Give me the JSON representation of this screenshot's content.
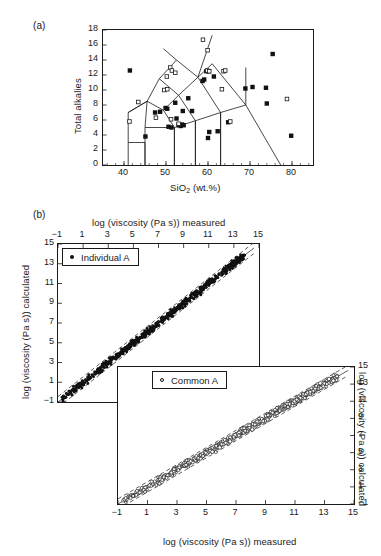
{
  "figure": {
    "panel_a_letter": "(a)",
    "panel_b_letter": "(b)"
  },
  "panel_a": {
    "xlabel_pre": "SiO",
    "xlabel_sub": "2",
    "xlabel_post": " (wt.%)",
    "ylabel": "Total alkalies",
    "x_ticks": [
      "40",
      "50",
      "60",
      "70",
      "80"
    ],
    "y_ticks": [
      "0",
      "2",
      "4",
      "6",
      "8",
      "10",
      "12",
      "14",
      "16",
      "18"
    ]
  },
  "panel_b": {
    "top_xlabel": "log (viscosity (Pa s)) measured",
    "bottom_xlabel": "log (viscosity (Pa s)) measured",
    "left_ylabel": "log (viscosity (Pa s)) calculated",
    "right_ylabel": "log (viscosity (Pa s)) calculated",
    "ticks": [
      "−1",
      "1",
      "3",
      "5",
      "7",
      "9",
      "11",
      "13",
      "15"
    ],
    "legend_individual": "Individual A",
    "legend_common": "Common A",
    "marker_individual": "filled-circle",
    "marker_common": "open-circle"
  },
  "colors": {
    "ink": "#1a1a1a",
    "marker_fill": "#111111",
    "marker_open": "#ffffff",
    "background": "#ffffff"
  },
  "chart_data": [
    {
      "type": "scatter",
      "id": "tas-diagram",
      "title": "",
      "xlabel": "SiO2 (wt.%)",
      "ylabel": "Total alkalies",
      "xlim": [
        35,
        85
      ],
      "ylim": [
        0,
        18
      ],
      "xticks": [
        40,
        50,
        60,
        70,
        80
      ],
      "yticks": [
        0,
        2,
        4,
        6,
        8,
        10,
        12,
        14,
        16,
        18
      ],
      "grid": false,
      "legend": "none",
      "series": [
        {
          "name": "filled squares",
          "marker": "filled-square",
          "points": [
            [
              41.4,
              12.6
            ],
            [
              45.1,
              3.8
            ],
            [
              47.4,
              7.0
            ],
            [
              48.6,
              7.1
            ],
            [
              49.9,
              7.6
            ],
            [
              50.3,
              7.5
            ],
            [
              50.6,
              5.1
            ],
            [
              51.3,
              5.0
            ],
            [
              52.2,
              8.3
            ],
            [
              52.5,
              6.2
            ],
            [
              53.0,
              5.3
            ],
            [
              53.5,
              5.2
            ],
            [
              53.8,
              5.4
            ],
            [
              54.2,
              5.3
            ],
            [
              54.0,
              7.2
            ],
            [
              55.3,
              8.9
            ],
            [
              56.2,
              7.2
            ],
            [
              58.7,
              11.2
            ],
            [
              59.1,
              11.4
            ],
            [
              59.6,
              12.5
            ],
            [
              60.2,
              12.5
            ],
            [
              60.0,
              3.6
            ],
            [
              60.3,
              4.4
            ],
            [
              61.4,
              11.8
            ],
            [
              62.3,
              4.5
            ],
            [
              64.8,
              5.7
            ],
            [
              68.9,
              10.2
            ],
            [
              70.6,
              10.4
            ],
            [
              73.8,
              10.3
            ],
            [
              74.0,
              8.2
            ],
            [
              75.4,
              14.8
            ],
            [
              79.8,
              3.9
            ]
          ]
        },
        {
          "name": "open squares",
          "marker": "open-square",
          "points": [
            [
              41.3,
              5.8
            ],
            [
              43.4,
              8.4
            ],
            [
              47.6,
              6.3
            ],
            [
              49.6,
              10.0
            ],
            [
              50.3,
              10.1
            ],
            [
              50.2,
              11.8
            ],
            [
              51.0,
              13.0
            ],
            [
              51.4,
              12.6
            ],
            [
              51.2,
              6.1
            ],
            [
              52.2,
              12.3
            ],
            [
              53.0,
              5.5
            ],
            [
              58.8,
              16.7
            ],
            [
              59.9,
              15.3
            ],
            [
              59.8,
              12.6
            ],
            [
              60.3,
              12.5
            ],
            [
              63.7,
              12.5
            ],
            [
              64.1,
              12.6
            ],
            [
              63.3,
              10.1
            ],
            [
              65.3,
              5.8
            ],
            [
              78.8,
              8.8
            ]
          ]
        }
      ],
      "field_boundaries": "TAS classification polygon lines"
    },
    {
      "type": "scatter",
      "id": "parity-individual-a",
      "title": "Individual A",
      "xlabel": "log (viscosity (Pa s)) measured",
      "ylabel": "log (viscosity (Pa s)) calculated",
      "xlim": [
        -1,
        15
      ],
      "ylim": [
        -1,
        15
      ],
      "xticks": [
        -1,
        1,
        3,
        5,
        7,
        9,
        11,
        13,
        15
      ],
      "yticks": [
        -1,
        1,
        3,
        5,
        7,
        9,
        11,
        13,
        15
      ],
      "grid": false,
      "marker": "filled-circle",
      "reference_line": {
        "slope": 1,
        "intercept": 0,
        "style": "solid"
      },
      "error_bands": {
        "offset": 0.55,
        "style": "dashed"
      },
      "n_points": 600,
      "description": "Dense 1:1 parity cloud spanning -1 to 14 on both axes"
    },
    {
      "type": "scatter",
      "id": "parity-common-a",
      "title": "Common A",
      "xlabel": "log (viscosity (Pa s)) measured",
      "ylabel": "log (viscosity (Pa s)) calculated",
      "xlim": [
        -1,
        15
      ],
      "ylim": [
        -1,
        15
      ],
      "xticks": [
        -1,
        1,
        3,
        5,
        7,
        9,
        11,
        13,
        15
      ],
      "yticks": [
        -1,
        1,
        3,
        5,
        7,
        9,
        11,
        13,
        15
      ],
      "grid": false,
      "marker": "open-circle",
      "reference_line": {
        "slope": 1,
        "intercept": 0,
        "style": "solid"
      },
      "error_bands": {
        "offset": 0.6,
        "style": "dashed"
      },
      "n_points": 600,
      "description": "Dense 1:1 parity cloud spanning -1 to 14 on both axes"
    }
  ]
}
